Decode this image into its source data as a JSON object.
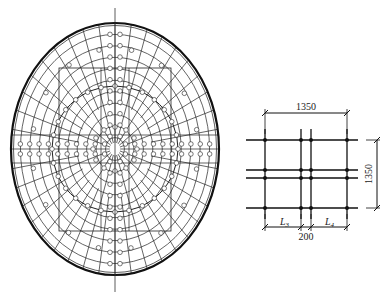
{
  "figure_left": {
    "name": "elliptical-dome-grid-plan",
    "ellipse": {
      "cx": 115,
      "cy": 149,
      "rx": 104,
      "ry": 126
    },
    "inner_rect": {
      "x": 59,
      "y": 68,
      "w": 112,
      "h": 163
    },
    "inner_ring_radius": 63,
    "axis_line": {
      "x": 115,
      "y1": 8,
      "y2": 292
    },
    "radial_count": 40,
    "ring_count": 11,
    "stroke_color": "#222222"
  },
  "figure_right": {
    "name": "grid-detail",
    "labels": {
      "top_dimension": "1350",
      "right_dimension": "1350",
      "bottom_gap": "200",
      "span_left": "L",
      "span_left_sub": "3",
      "span_right": "L",
      "span_right_sub": "4"
    },
    "vertical_lines_x": [
      265,
      301,
      311,
      347
    ],
    "horizontal_lines_y": [
      140,
      170,
      178,
      208
    ],
    "stroke_color": "#111111"
  }
}
